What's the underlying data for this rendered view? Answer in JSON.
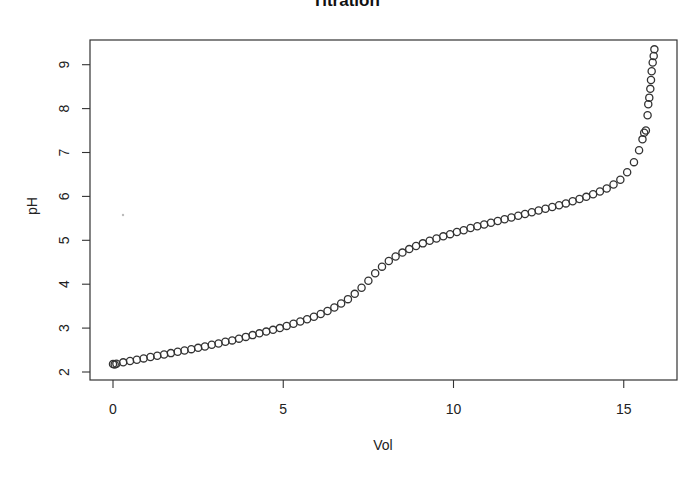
{
  "chart_data": {
    "type": "scatter",
    "title": "Titration",
    "xlabel": "Vol",
    "ylabel": "pH",
    "xlim": [
      -0.7,
      16.5
    ],
    "ylim": [
      1.8,
      9.6
    ],
    "xticks": [
      0,
      5,
      10,
      15
    ],
    "yticks": [
      2,
      3,
      4,
      5,
      6,
      7,
      8,
      9
    ],
    "grid": false,
    "legend": null,
    "marker": "open-circle",
    "x": [
      0,
      0.05,
      0.1,
      0.3,
      0.5,
      0.7,
      0.9,
      1.1,
      1.3,
      1.5,
      1.7,
      1.9,
      2.1,
      2.3,
      2.5,
      2.7,
      2.9,
      3.1,
      3.3,
      3.5,
      3.7,
      3.9,
      4.1,
      4.3,
      4.5,
      4.7,
      4.9,
      5.1,
      5.3,
      5.5,
      5.7,
      5.9,
      6.1,
      6.3,
      6.5,
      6.7,
      6.9,
      7.1,
      7.3,
      7.5,
      7.7,
      7.9,
      8.1,
      8.3,
      8.5,
      8.7,
      8.9,
      9.1,
      9.3,
      9.5,
      9.7,
      9.9,
      10.1,
      10.3,
      10.5,
      10.7,
      10.9,
      11.1,
      11.3,
      11.5,
      11.7,
      11.9,
      12.1,
      12.3,
      12.5,
      12.7,
      12.9,
      13.1,
      13.3,
      13.5,
      13.7,
      13.9,
      14.1,
      14.3,
      14.5,
      14.7,
      14.9,
      15.1,
      15.3,
      15.45,
      15.55,
      15.6,
      15.65,
      15.7,
      15.72,
      15.75,
      15.78,
      15.8,
      15.82,
      15.85,
      15.88,
      15.9
    ],
    "y": [
      2.18,
      2.17,
      2.19,
      2.22,
      2.25,
      2.28,
      2.31,
      2.34,
      2.37,
      2.4,
      2.43,
      2.46,
      2.49,
      2.52,
      2.55,
      2.58,
      2.62,
      2.65,
      2.69,
      2.72,
      2.76,
      2.8,
      2.84,
      2.88,
      2.92,
      2.96,
      3.0,
      3.05,
      3.1,
      3.15,
      3.2,
      3.26,
      3.32,
      3.39,
      3.47,
      3.56,
      3.66,
      3.78,
      3.92,
      4.08,
      4.25,
      4.4,
      4.53,
      4.63,
      4.72,
      4.8,
      4.87,
      4.93,
      4.99,
      5.04,
      5.09,
      5.14,
      5.19,
      5.23,
      5.28,
      5.32,
      5.36,
      5.4,
      5.44,
      5.48,
      5.52,
      5.56,
      5.6,
      5.64,
      5.68,
      5.72,
      5.76,
      5.8,
      5.84,
      5.89,
      5.94,
      5.99,
      6.05,
      6.11,
      6.18,
      6.27,
      6.38,
      6.55,
      6.78,
      7.05,
      7.3,
      7.45,
      7.5,
      7.85,
      8.1,
      8.25,
      8.45,
      8.65,
      8.85,
      9.05,
      9.2,
      9.35
    ]
  }
}
